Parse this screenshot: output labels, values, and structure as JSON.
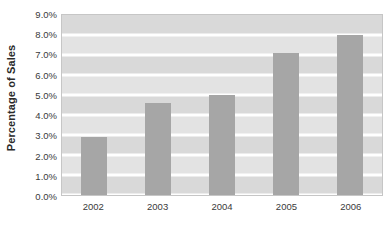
{
  "chart_data": {
    "type": "bar",
    "title": "",
    "xlabel": "",
    "ylabel": "Percentage of Sales",
    "categories": [
      "2002",
      "2003",
      "2004",
      "2005",
      "2006"
    ],
    "values": [
      2.9,
      4.6,
      5.0,
      7.1,
      8.0
    ],
    "value_labels": [
      "2.9%",
      "4.6%",
      "5.0%",
      "7.1%",
      "8.0%"
    ],
    "ylim": [
      0,
      9
    ],
    "ytick_values": [
      0,
      1,
      2,
      3,
      4,
      5,
      6,
      7,
      8,
      9
    ],
    "ytick_labels": [
      "0.0%",
      "1.0%",
      "2.0%",
      "3.0%",
      "4.0%",
      "5.0%",
      "6.0%",
      "7.0%",
      "8.0%",
      "9.0%"
    ],
    "grid": true,
    "legend": false,
    "legend_position": "none",
    "series": [
      {
        "name": "Percentage of Sales",
        "values": [
          2.9,
          4.6,
          5.0,
          7.1,
          8.0
        ]
      }
    ]
  },
  "colors": {
    "bar_fill": "#a6a6a6",
    "plot_band_dark": "#d9d9d9",
    "plot_band_light": "#e3e3e3",
    "grid_line": "#ffffff",
    "plot_border": "#c6c6c6",
    "text": "#3a3a3a",
    "title_text": "#2a2a2a",
    "background": "#ffffff"
  }
}
